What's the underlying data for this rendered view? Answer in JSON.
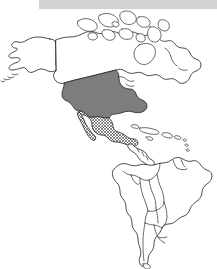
{
  "figure": {
    "kind": "thematic-outline-map",
    "title_visible": false,
    "width_px": 217,
    "height_px": 269,
    "background_color": "#ffffff",
    "outline_color": "#2b2b2b"
  },
  "top_band": {
    "label": "header-band",
    "color": "#d2d2d2",
    "x": 39,
    "y": 0,
    "width": 178,
    "height": 9
  },
  "map": {
    "extent_label": "The Americas",
    "projection_note": "North and South America shown, Greenland cropped at right edge",
    "landmasses": [
      {
        "id": "alaska",
        "label": "Alaska",
        "fill": "none"
      },
      {
        "id": "canada",
        "label": "Canada",
        "fill": "none"
      },
      {
        "id": "arctic-islands",
        "label": "Canadian Arctic Archipelago",
        "fill": "none"
      },
      {
        "id": "united-states",
        "label": "United States",
        "fill": "solid-gray"
      },
      {
        "id": "mexico",
        "label": "Mexico",
        "fill": "crosshatch"
      },
      {
        "id": "central-america",
        "label": "Central America",
        "fill": "none"
      },
      {
        "id": "caribbean",
        "label": "Caribbean Islands",
        "fill": "none"
      },
      {
        "id": "south-america",
        "label": "South America",
        "fill": "none"
      }
    ],
    "highlight_styles": [
      {
        "key": "solid-gray",
        "color": "#7d7d7d",
        "applies_to": "United States"
      },
      {
        "key": "crosshatch",
        "color": "#2b2b2b",
        "applies_to": "Mexico"
      },
      {
        "key": "none",
        "color": "#ffffff",
        "applies_to": "all other countries"
      }
    ]
  }
}
